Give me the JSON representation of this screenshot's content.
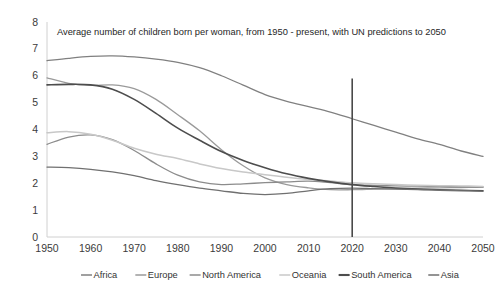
{
  "chart_data": {
    "type": "line",
    "title": "Average number of children born per woman, from 1950 - present, with UN predictions to 2050",
    "xlabel": "",
    "ylabel": "",
    "xlim": [
      1950,
      2050
    ],
    "ylim": [
      0,
      8
    ],
    "grid": false,
    "legend_position": "bottom",
    "x_ticks": [
      "1950",
      "1960",
      "1970",
      "1980",
      "1990",
      "2000",
      "2010",
      "2020",
      "2030",
      "2040",
      "2050"
    ],
    "y_ticks": [
      "0",
      "1",
      "2",
      "3",
      "4",
      "5",
      "6",
      "7",
      "8"
    ],
    "x": [
      1950,
      1955,
      1960,
      1965,
      1970,
      1975,
      1980,
      1985,
      1990,
      1995,
      2000,
      2005,
      2010,
      2015,
      2020,
      2025,
      2030,
      2035,
      2040,
      2045,
      2050
    ],
    "annotations": [
      {
        "name": "present-marker",
        "type": "vertical-line",
        "x": 2020,
        "y_from": 0,
        "y_to": 5.9,
        "color": "#4a4a4a"
      }
    ],
    "series": [
      {
        "name": "Africa",
        "color": "#808080",
        "width": 1.3,
        "values": [
          6.56,
          6.65,
          6.72,
          6.74,
          6.7,
          6.62,
          6.5,
          6.3,
          6.0,
          5.65,
          5.3,
          5.05,
          4.85,
          4.65,
          4.4,
          4.15,
          3.9,
          3.65,
          3.45,
          3.2,
          3.0
        ]
      },
      {
        "name": "Europe",
        "color": "#9a9a9a",
        "width": 1.3,
        "values": [
          5.92,
          5.72,
          5.64,
          5.66,
          5.52,
          5.12,
          4.55,
          3.95,
          3.25,
          2.65,
          2.2,
          1.95,
          1.83,
          1.76,
          1.76,
          1.78,
          1.8,
          1.82,
          1.83,
          1.84,
          1.85
        ]
      },
      {
        "name": "North America",
        "color": "#8c8c8c",
        "width": 1.3,
        "values": [
          3.45,
          3.72,
          3.8,
          3.62,
          3.22,
          2.72,
          2.3,
          2.05,
          1.95,
          1.98,
          2.02,
          2.05,
          2.08,
          2.02,
          1.95,
          1.92,
          1.9,
          1.89,
          1.88,
          1.87,
          1.86
        ]
      },
      {
        "name": "Oceania",
        "color": "#c8c8c8",
        "width": 1.5,
        "values": [
          3.88,
          3.92,
          3.82,
          3.6,
          3.3,
          3.08,
          2.92,
          2.72,
          2.55,
          2.42,
          2.32,
          2.22,
          2.14,
          2.08,
          2.02,
          1.98,
          1.95,
          1.93,
          1.91,
          1.9,
          1.88
        ]
      },
      {
        "name": "South America",
        "color": "#4d4d4d",
        "width": 1.6,
        "values": [
          5.66,
          5.68,
          5.66,
          5.5,
          5.12,
          4.6,
          4.05,
          3.6,
          3.18,
          2.85,
          2.58,
          2.35,
          2.18,
          2.05,
          1.95,
          1.88,
          1.82,
          1.78,
          1.76,
          1.74,
          1.72
        ]
      },
      {
        "name": "Asia",
        "color": "#707070",
        "width": 1.3,
        "values": [
          2.6,
          2.58,
          2.52,
          2.42,
          2.28,
          2.1,
          1.95,
          1.82,
          1.72,
          1.62,
          1.58,
          1.62,
          1.72,
          1.8,
          1.82,
          1.8,
          1.78,
          1.76,
          1.74,
          1.72,
          1.7
        ]
      }
    ]
  },
  "legend": {
    "items": [
      {
        "label": "Africa",
        "color": "#808080"
      },
      {
        "label": "Europe",
        "color": "#9a9a9a"
      },
      {
        "label": "North America",
        "color": "#8c8c8c"
      },
      {
        "label": "Oceania",
        "color": "#c8c8c8"
      },
      {
        "label": "South America",
        "color": "#4d4d4d"
      },
      {
        "label": "Asia",
        "color": "#707070"
      }
    ]
  }
}
